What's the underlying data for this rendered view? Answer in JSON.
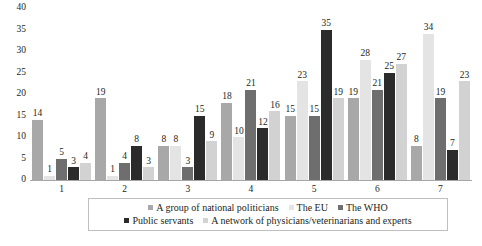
{
  "chart_data": {
    "type": "bar",
    "title": "",
    "subtitle": "",
    "xlabel": "",
    "ylabel": "",
    "categories": [
      "1",
      "2",
      "3",
      "4",
      "5",
      "6",
      "7"
    ],
    "ylim": [
      0,
      40
    ],
    "y_ticks": [
      0,
      5,
      10,
      15,
      20,
      25,
      30,
      35,
      40
    ],
    "grid": false,
    "legend_position": "bottom",
    "data_labels": true,
    "series": [
      {
        "name": "A group of national politicians",
        "color": "#a8a8a8",
        "values": [
          14,
          19,
          8,
          18,
          15,
          19,
          8
        ]
      },
      {
        "name": "The EU",
        "color": "#e4e4e4",
        "values": [
          1,
          1,
          8,
          10,
          23,
          28,
          34
        ]
      },
      {
        "name": "The WHO",
        "color": "#6e6e6e",
        "values": [
          5,
          4,
          3,
          21,
          15,
          21,
          19
        ]
      },
      {
        "name": "Public servants",
        "color": "#2b2b2b",
        "values": [
          3,
          8,
          15,
          12,
          35,
          25,
          7
        ]
      },
      {
        "name": "A network of physicians/veterinarians and experts",
        "color": "#d2d2d2",
        "values": [
          4,
          3,
          9,
          16,
          19,
          27,
          23
        ]
      }
    ]
  },
  "axis": {
    "y_tick_labels": [
      "0",
      "5",
      "10",
      "15",
      "20",
      "25",
      "30",
      "35",
      "40"
    ],
    "x_tick_labels": [
      "1",
      "2",
      "3",
      "4",
      "5",
      "6",
      "7"
    ]
  },
  "colors": {
    "axis_line": "#a6a6a6",
    "text": "#231f20",
    "legend_border": "#bfbfbf",
    "background": "#ffffff"
  }
}
